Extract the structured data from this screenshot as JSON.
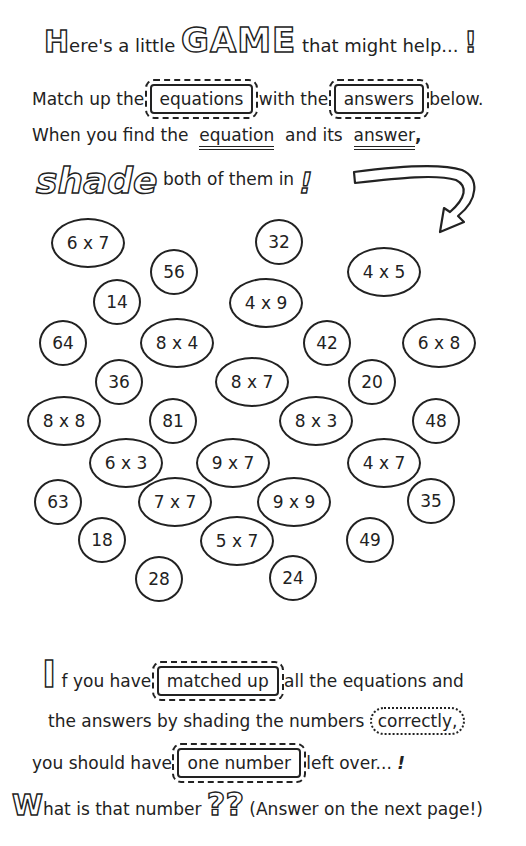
{
  "intro": {
    "line1": {
      "cap": "H",
      "before": "ere's a little",
      "game_word": "GAME",
      "after": "that might help...",
      "mark": "!"
    },
    "line2": {
      "before": "Match up the",
      "word1": "equations",
      "middle": "with the",
      "word2": "answers",
      "after": "below."
    },
    "line3": {
      "before": "When you find the",
      "word1": "equation",
      "middle": "and its",
      "word2": "answer",
      "after": ","
    },
    "line4": {
      "shade_word": "shade",
      "after": "both of them in",
      "mark": "!"
    }
  },
  "puzzle": {
    "items": [
      {
        "text": "6 x 7",
        "kind": "equation"
      },
      {
        "text": "32",
        "kind": "answer"
      },
      {
        "text": "56",
        "kind": "answer"
      },
      {
        "text": "4 x 5",
        "kind": "equation"
      },
      {
        "text": "14",
        "kind": "answer"
      },
      {
        "text": "4 x 9",
        "kind": "equation"
      },
      {
        "text": "64",
        "kind": "answer"
      },
      {
        "text": "8 x 4",
        "kind": "equation"
      },
      {
        "text": "42",
        "kind": "answer"
      },
      {
        "text": "6 x 8",
        "kind": "equation"
      },
      {
        "text": "36",
        "kind": "answer"
      },
      {
        "text": "8 x 7",
        "kind": "equation"
      },
      {
        "text": "20",
        "kind": "answer"
      },
      {
        "text": "8 x 8",
        "kind": "equation"
      },
      {
        "text": "81",
        "kind": "answer"
      },
      {
        "text": "8 x 3",
        "kind": "equation"
      },
      {
        "text": "48",
        "kind": "answer"
      },
      {
        "text": "6 x 3",
        "kind": "equation"
      },
      {
        "text": "9 x 7",
        "kind": "equation"
      },
      {
        "text": "4 x 7",
        "kind": "equation"
      },
      {
        "text": "63",
        "kind": "answer"
      },
      {
        "text": "7 x 7",
        "kind": "equation"
      },
      {
        "text": "9 x 9",
        "kind": "equation"
      },
      {
        "text": "35",
        "kind": "answer"
      },
      {
        "text": "18",
        "kind": "answer"
      },
      {
        "text": "5 x 7",
        "kind": "equation"
      },
      {
        "text": "49",
        "kind": "answer"
      },
      {
        "text": "28",
        "kind": "answer"
      },
      {
        "text": "24",
        "kind": "answer"
      }
    ]
  },
  "outro": {
    "line1": {
      "cap": "I",
      "before": "f you have",
      "word": "matched up",
      "after": "all the equations and"
    },
    "line2": {
      "before": "the answers by shading the numbers",
      "word": "correctly,"
    },
    "line3": {
      "before": "you should have",
      "word": "one number",
      "after": "left over...",
      "mark": "!"
    },
    "line4": {
      "cap": "W",
      "before": "hat is that number",
      "marks": "??",
      "after": "(Answer on the next page!)"
    }
  }
}
